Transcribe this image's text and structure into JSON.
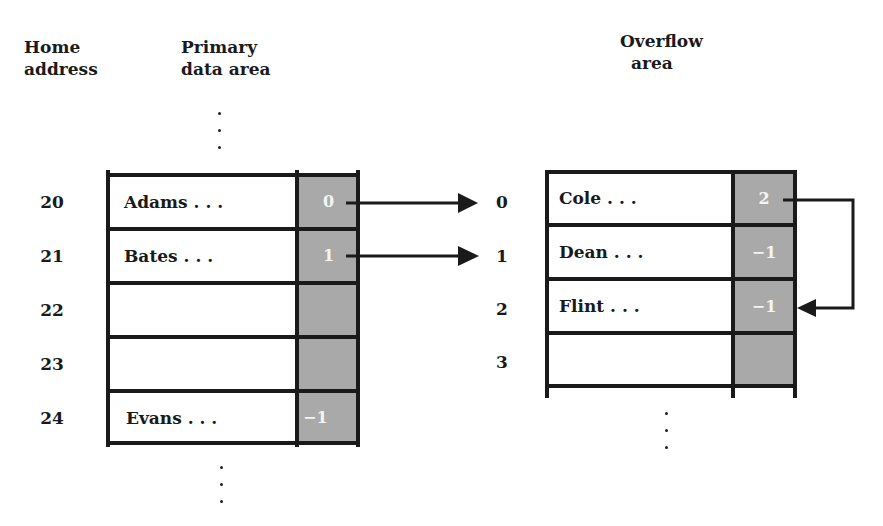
{
  "headers": {
    "home_address": [
      "Home",
      "address"
    ],
    "primary": [
      "Primary",
      "data area"
    ],
    "overflow": [
      "Overflow",
      "area"
    ]
  },
  "primary_area": {
    "rows": [
      {
        "address": "20",
        "data": "Adams . . .",
        "pointer": "0"
      },
      {
        "address": "21",
        "data": "Bates . . .",
        "pointer": "1"
      },
      {
        "address": "22",
        "data": "",
        "pointer": ""
      },
      {
        "address": "23",
        "data": "",
        "pointer": ""
      },
      {
        "address": "24",
        "data": "Evans . . .",
        "pointer": "−1"
      }
    ]
  },
  "overflow_area": {
    "rows": [
      {
        "index": "0",
        "data": "Cole . . .",
        "pointer": "2"
      },
      {
        "index": "1",
        "data": "Dean . . .",
        "pointer": "−1"
      },
      {
        "index": "2",
        "data": "Flint . . .",
        "pointer": "−1"
      },
      {
        "index": "3",
        "data": "",
        "pointer": ""
      }
    ]
  },
  "arrows": [
    {
      "from": "primary.20.pointer",
      "to": "overflow.0"
    },
    {
      "from": "primary.21.pointer",
      "to": "overflow.1"
    },
    {
      "from": "overflow.0.pointer",
      "to": "overflow.2"
    }
  ],
  "colors": {
    "pointer_fill": "#a9a9a9",
    "line": "#1a1a1a"
  }
}
